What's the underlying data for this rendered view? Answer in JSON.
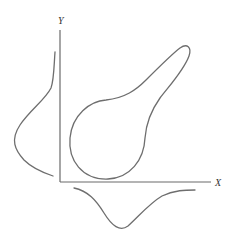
{
  "diagram": {
    "type": "joint-distribution-with-marginals",
    "axes": {
      "x_label": "X",
      "y_label": "Y"
    },
    "elements": [
      {
        "name": "joint-density-contour",
        "shape": "pear/teardrop closed contour elongated toward upper-right"
      },
      {
        "name": "marginal-density-y",
        "position": "left of Y axis"
      },
      {
        "name": "marginal-density-x",
        "position": "below X axis"
      }
    ],
    "colors": {
      "stroke": "#6e6e6e",
      "background": "#ffffff"
    }
  }
}
